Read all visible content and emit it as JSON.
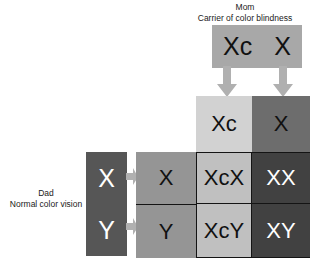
{
  "diagram": {
    "type": "punnett-square",
    "title_mother": "Mom\nCarrier of color blindness",
    "title_father": "Dad\nNormal color vision"
  },
  "mother": {
    "label_line1": "Mom",
    "label_line2": "Carrier of color blindness",
    "caption": "Mom\nCarrier of color blindness",
    "genotype_alleles": [
      "Xc",
      "X"
    ],
    "allele_0": "Xc",
    "allele_1": "X"
  },
  "father": {
    "label_line1": "Dad",
    "label_line2": "Normal color vision",
    "caption": "Dad\nNormal color vision",
    "genotype_alleles": [
      "X",
      "Y"
    ],
    "allele_0": "X",
    "allele_1": "Y"
  },
  "grid": {
    "column_headers": [
      "Xc",
      "X"
    ],
    "row_headers": [
      "X",
      "Y"
    ],
    "offspring": [
      [
        "XcX",
        "XX"
      ],
      [
        "XcY",
        "XY"
      ]
    ],
    "cell_0_0": "XcX",
    "cell_0_1": "XX",
    "cell_1_0": "XcY",
    "cell_1_1": "XY"
  },
  "colors": {
    "mom_box": "#a8a8a8",
    "dad_box": "#565656",
    "column_light": "#d2d2d2",
    "column_dark": "#6d6d6d",
    "row_header": "#959595",
    "result_light": "#c0c0c0",
    "result_dark": "#414141",
    "arrow": "#b0b0b0",
    "text_dark": "#111111",
    "text_light": "#ffffff",
    "background": "#ffffff"
  },
  "icons": {
    "arrow_down": "arrow-down-icon",
    "arrow_right": "arrow-right-icon"
  }
}
